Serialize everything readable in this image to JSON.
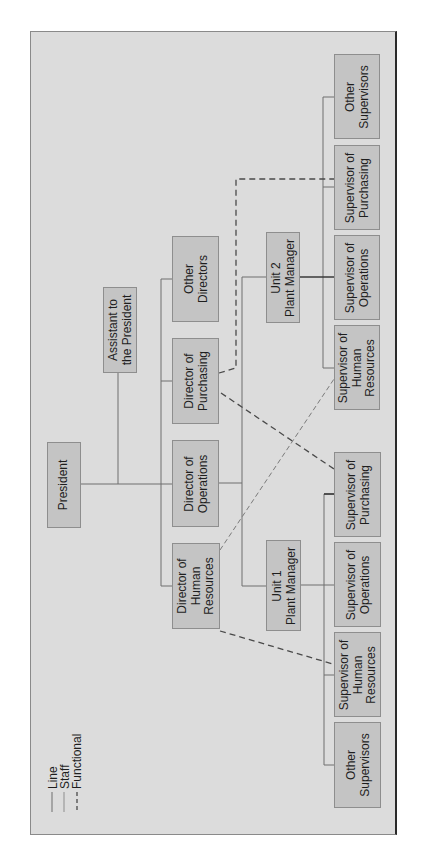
{
  "chart_title": "",
  "orientation": "rotated-90-ccw",
  "colors": {
    "frame_background": "#dcdcdc",
    "box_fill": "#c4c4c4",
    "box_border": "#8e8e8e",
    "line": "#6e6e6e",
    "functional_dash": "#4a4a4a",
    "text": "#1e1e1e"
  },
  "legend": {
    "items": [
      {
        "label": "Line",
        "style": "solid"
      },
      {
        "label": "Staff",
        "style": "solid-light"
      },
      {
        "label": "Functional",
        "style": "dashed"
      }
    ]
  },
  "nodes": {
    "president": {
      "label": "President"
    },
    "assistant": {
      "label": "Assistant to\nthe President"
    },
    "dir_hr": {
      "label": "Director of\nHuman\nResources"
    },
    "dir_ops": {
      "label": "Director of\nOperations"
    },
    "dir_purch": {
      "label": "Director of\nPurchasing"
    },
    "other_directors": {
      "label": "Other\nDirectors"
    },
    "unit1_pm": {
      "label": "Unit 1\nPlant Manager"
    },
    "unit2_pm": {
      "label": "Unit 2\nPlant Manager"
    },
    "u1_other_sup": {
      "label": "Other\nSupervisors"
    },
    "u1_sup_hr": {
      "label": "Supervisor of\nHuman\nResources"
    },
    "u1_sup_ops": {
      "label": "Supervisor of\nOperations"
    },
    "u1_sup_purch": {
      "label": "Supervisor of\nPurchasing"
    },
    "u2_sup_hr": {
      "label": "Supervisor of\nHuman\nResources"
    },
    "u2_sup_ops": {
      "label": "Supervisor of\nOperations"
    },
    "u2_sup_purch": {
      "label": "Supervisor of\nPurchasing"
    },
    "u2_other_sup": {
      "label": "Other\nSupervisors"
    }
  },
  "edges": {
    "line": [
      [
        "president",
        "dir_hr"
      ],
      [
        "president",
        "dir_ops"
      ],
      [
        "president",
        "dir_purch"
      ],
      [
        "president",
        "other_directors"
      ],
      [
        "dir_ops",
        "unit1_pm"
      ],
      [
        "dir_ops",
        "unit2_pm"
      ],
      [
        "unit1_pm",
        "u1_other_sup"
      ],
      [
        "unit1_pm",
        "u1_sup_hr"
      ],
      [
        "unit1_pm",
        "u1_sup_ops"
      ],
      [
        "unit1_pm",
        "u1_sup_purch"
      ],
      [
        "unit2_pm",
        "u2_sup_hr"
      ],
      [
        "unit2_pm",
        "u2_sup_ops"
      ],
      [
        "unit2_pm",
        "u2_sup_purch"
      ],
      [
        "unit2_pm",
        "u2_other_sup"
      ]
    ],
    "staff": [
      [
        "president",
        "assistant"
      ]
    ],
    "functional": [
      [
        "dir_purch",
        "u2_sup_purch"
      ],
      [
        "dir_purch",
        "u1_sup_purch"
      ],
      [
        "dir_hr",
        "u2_sup_hr"
      ],
      [
        "dir_hr",
        "u1_sup_hr"
      ]
    ]
  }
}
